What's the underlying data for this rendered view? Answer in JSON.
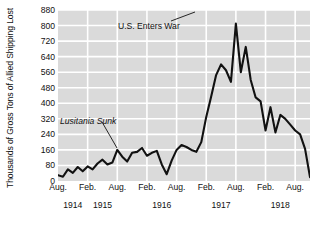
{
  "chart_data": {
    "type": "line",
    "title": "",
    "xlabel": "",
    "ylabel": "Thousands of Gross Tons of Allied Shipping Lost",
    "ylim": [
      0,
      880
    ],
    "yticks": [
      0,
      80,
      160,
      240,
      320,
      400,
      480,
      560,
      640,
      720,
      800,
      880
    ],
    "grid": true,
    "legend": null,
    "plot_background": "#dadada",
    "gridline_color": "#ffffff",
    "line_color": "#111111",
    "xticks": [
      {
        "label": "Aug.",
        "month_index": 0
      },
      {
        "label": "Feb.",
        "month_index": 6
      },
      {
        "label": "Aug.",
        "month_index": 12
      },
      {
        "label": "Feb.",
        "month_index": 18
      },
      {
        "label": "Aug.",
        "month_index": 24
      },
      {
        "label": "Feb.",
        "month_index": 30
      },
      {
        "label": "Aug.",
        "month_index": 36
      },
      {
        "label": "Feb.",
        "month_index": 42
      },
      {
        "label": "Aug.",
        "month_index": 48
      }
    ],
    "years": [
      {
        "label": "1914",
        "month_index": 3
      },
      {
        "label": "1915",
        "month_index": 9
      },
      {
        "label": "1916",
        "month_index": 21
      },
      {
        "label": "1917",
        "month_index": 33
      },
      {
        "label": "1918",
        "month_index": 45
      }
    ],
    "x_month_labels": [
      "Aug. 1914",
      "Sep. 1914",
      "Oct. 1914",
      "Nov. 1914",
      "Dec. 1914",
      "Jan. 1915",
      "Feb. 1915",
      "Mar. 1915",
      "Apr. 1915",
      "May 1915",
      "Jun. 1915",
      "Jul. 1915",
      "Aug. 1915",
      "Sep. 1915",
      "Oct. 1915",
      "Nov. 1915",
      "Dec. 1915",
      "Jan. 1916",
      "Feb. 1916",
      "Mar. 1916",
      "Apr. 1916",
      "May 1916",
      "Jun. 1916",
      "Jul. 1916",
      "Aug. 1916",
      "Sep. 1916",
      "Oct. 1916",
      "Nov. 1916",
      "Dec. 1916",
      "Jan. 1917",
      "Feb. 1917",
      "Mar. 1917",
      "Apr. 1917",
      "May 1917",
      "Jun. 1917",
      "Jul. 1917",
      "Aug. 1917",
      "Sep. 1917",
      "Oct. 1917",
      "Nov. 1917",
      "Dec. 1917",
      "Jan. 1918",
      "Feb. 1918",
      "Mar. 1918",
      "Apr. 1918",
      "May 1918",
      "Jun. 1918",
      "Jul. 1918",
      "Aug. 1918",
      "Sep. 1918",
      "Oct. 1918",
      "Nov. 1918"
    ],
    "values": [
      30,
      22,
      60,
      42,
      72,
      50,
      75,
      60,
      90,
      110,
      85,
      95,
      160,
      125,
      100,
      145,
      150,
      170,
      130,
      145,
      155,
      85,
      35,
      105,
      160,
      185,
      175,
      160,
      150,
      200,
      330,
      435,
      545,
      600,
      570,
      510,
      810,
      560,
      690,
      520,
      430,
      410,
      260,
      380,
      250,
      340,
      320,
      290,
      260,
      240,
      165,
      20
    ],
    "annotations": [
      {
        "text": "U.S. Enters War",
        "italic": false
      },
      {
        "text": "Lusitania Sunk",
        "italic": true
      }
    ]
  }
}
